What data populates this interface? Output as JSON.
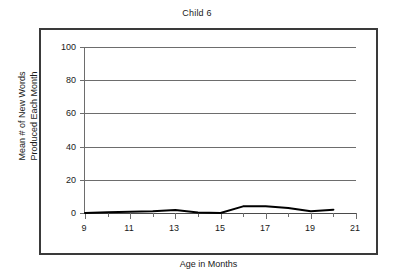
{
  "chart_data": {
    "type": "line",
    "title": "Child 6",
    "xlabel": "Age in Months",
    "ylabel": "Mean # of New Words Produced Each Month",
    "ylabel_line1": "Mean # of New Words",
    "ylabel_line2": "Produced Each Month",
    "xlim": [
      9,
      21
    ],
    "ylim": [
      0,
      100
    ],
    "grid": true,
    "legend": false,
    "line_color": "#000000",
    "x_major_ticks": [
      9,
      11,
      13,
      15,
      17,
      19,
      21
    ],
    "x_minor_ticks": [
      10,
      12,
      14,
      16,
      18,
      20
    ],
    "x_tick_labels": [
      "9",
      "11",
      "13",
      "15",
      "17",
      "19",
      "21"
    ],
    "y_ticks": [
      0,
      20,
      40,
      60,
      80,
      100
    ],
    "y_tick_labels": [
      "0",
      "20",
      "40",
      "60",
      "80",
      "100"
    ],
    "x": [
      9,
      10,
      11,
      12,
      13,
      14,
      15,
      16,
      17,
      18,
      19,
      20
    ],
    "values": [
      0,
      0.5,
      0.7,
      1,
      1.8,
      0.3,
      0,
      4,
      4,
      3,
      1,
      2
    ],
    "series": [
      {
        "name": "Child 6",
        "x": [
          9,
          10,
          11,
          12,
          13,
          14,
          15,
          16,
          17,
          18,
          19,
          20
        ],
        "values": [
          0,
          0.5,
          0.7,
          1,
          1.8,
          0.3,
          0,
          4,
          4,
          3,
          1,
          2
        ]
      }
    ]
  }
}
